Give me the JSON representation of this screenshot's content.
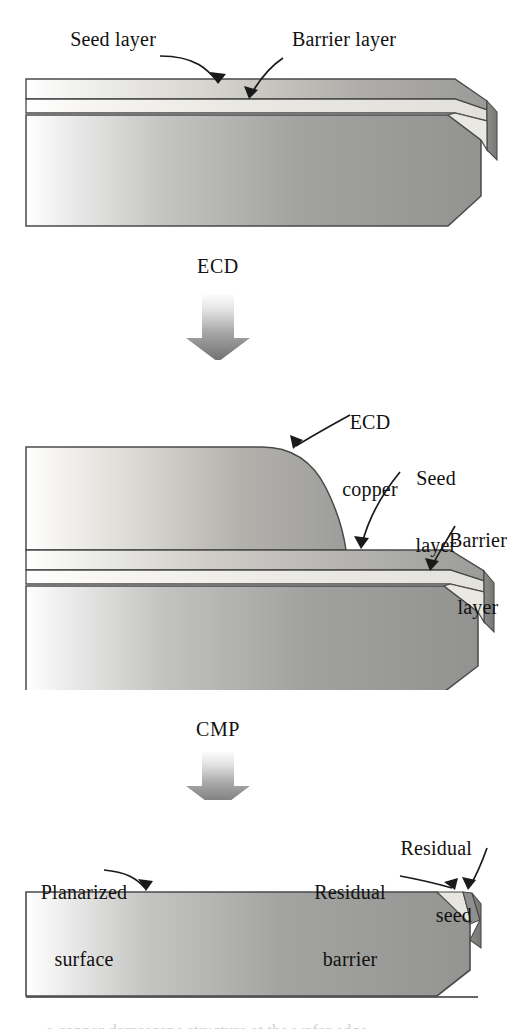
{
  "figure": {
    "width": 528,
    "height": 1029,
    "background": "#ffffff"
  },
  "colors": {
    "ink": "#111111",
    "outline": "#4a4a4a",
    "barrier_dark": "#8d8d8d",
    "seed_light": "#eceae4",
    "copper_mid": "#a3a3a3",
    "substrate": "#9c9c9c",
    "arrow_top": "#f2f2f2",
    "arrow_bottom": "#6f6f6f",
    "bevel_shadow": "#7c7c7c"
  },
  "panels": [
    {
      "id": "panel-as-deposited",
      "name": "barrier-and-seed-stack",
      "labels": [
        {
          "id": "seed-layer-label",
          "lines": "Seed layer",
          "align": "right"
        },
        {
          "id": "barrier-layer-label",
          "lines": "Barrier layer",
          "align": "left"
        }
      ]
    },
    {
      "id": "panel-after-ecd",
      "name": "ecd-copper-overburden",
      "labels": [
        {
          "id": "ecd-copper-label",
          "line1": "ECD",
          "line2": "copper",
          "align": "center"
        },
        {
          "id": "seed-layer-label-2",
          "line1": "Seed",
          "line2": "layer",
          "align": "center"
        },
        {
          "id": "barrier-layer-label-2",
          "line1": "Barrier",
          "line2": "layer",
          "align": "center"
        }
      ]
    },
    {
      "id": "panel-after-cmp",
      "name": "planarized-with-residues",
      "labels": [
        {
          "id": "planarized-surface-label",
          "line1": "Planarized",
          "line2": "surface",
          "align": "center"
        },
        {
          "id": "residual-seed-label",
          "line1": "Residual",
          "line2": "seed",
          "align": "right"
        },
        {
          "id": "residual-barrier-label",
          "line1": "Residual",
          "line2": "barrier",
          "align": "center"
        }
      ]
    }
  ],
  "steps": [
    {
      "id": "step-ecd",
      "label": "ECD",
      "arrow": "down-gradient-arrow"
    },
    {
      "id": "step-cmp",
      "label": "CMP",
      "arrow": "down-gradient-arrow"
    }
  ],
  "text": {
    "seed_layer": "Seed layer",
    "barrier_layer": "Barrier layer",
    "ecd": "ECD",
    "ecd_copper_l1": "ECD",
    "ecd_copper_l2": "copper",
    "seed_l1": "Seed",
    "seed_l2": "layer",
    "barrier_l1": "Barrier",
    "barrier_l2": "layer",
    "cmp": "CMP",
    "planarized_l1": "Planarized",
    "planarized_l2": "surface",
    "residual_seed_l1": "Residual",
    "residual_seed_l2": "seed",
    "residual_barrier_l1": "Residual",
    "residual_barrier_l2": "barrier",
    "caption_sliver": "a copper damascene structure at the wafer edge"
  }
}
